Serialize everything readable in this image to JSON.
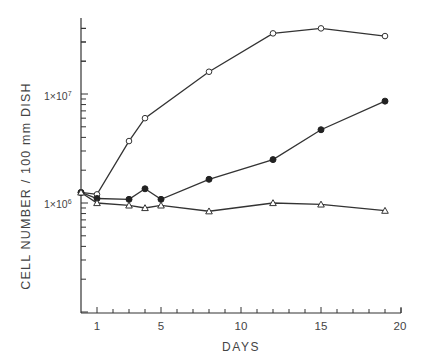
{
  "chart_data": {
    "type": "line",
    "title": "",
    "xlabel": "DAYS",
    "ylabel": "CELL NUMBER / 100 mm DISH",
    "yscale": "log",
    "xlim": [
      0,
      20
    ],
    "ylim": [
      100000,
      50000000
    ],
    "x_ticks": [
      1,
      5,
      10,
      15,
      20
    ],
    "y_ticks": [
      {
        "label": "1×10^6",
        "value": 1000000
      },
      {
        "label": "1×10^7",
        "value": 10000000
      }
    ],
    "grid": false,
    "legend": null,
    "series": [
      {
        "name": "open circles",
        "marker": "open-circle",
        "x": [
          0,
          1,
          3,
          4,
          8,
          12,
          15,
          19
        ],
        "y": [
          1250000,
          1200000,
          3700000,
          6000000,
          16000000,
          36000000,
          40000000,
          34000000
        ]
      },
      {
        "name": "filled circles",
        "marker": "filled-circle",
        "x": [
          0,
          1,
          3,
          4,
          5,
          8,
          12,
          15,
          19
        ],
        "y": [
          1250000,
          1100000,
          1080000,
          1350000,
          1080000,
          1650000,
          2500000,
          4700000,
          8600000
        ]
      },
      {
        "name": "open triangles",
        "marker": "open-triangle",
        "x": [
          0,
          1,
          3,
          4,
          5,
          8,
          12,
          15,
          19
        ],
        "y": [
          1250000,
          1000000,
          950000,
          900000,
          950000,
          840000,
          1000000,
          970000,
          850000
        ]
      }
    ]
  },
  "labels": {
    "xlabel": "DAYS",
    "ylabel": "CELL NUMBER / 100 mm DISH",
    "x_ticks": [
      "1",
      "5",
      "10",
      "15",
      "20"
    ],
    "y_tick_1e6": "1×10",
    "y_tick_1e6_exp": "6",
    "y_tick_1e7": "1×10",
    "y_tick_1e7_exp": "7"
  }
}
